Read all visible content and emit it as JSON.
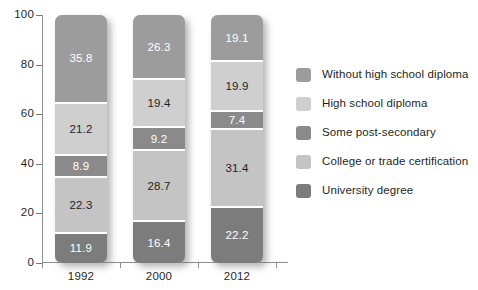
{
  "chart_data": {
    "type": "bar",
    "subtype": "stacked-bar-100",
    "title": "",
    "subtitle": "",
    "xlabel": "",
    "ylabel": "",
    "categories": [
      "1992",
      "2000",
      "2012"
    ],
    "ylim": [
      0,
      100
    ],
    "yticks": [
      0,
      20,
      40,
      60,
      80,
      100
    ],
    "ytick_labels": [
      "0",
      "20",
      "40",
      "60",
      "80",
      "100"
    ],
    "grid": false,
    "legend_position": "right",
    "stack_order_bottom_to_top": [
      "University degree",
      "College or trade certification",
      "Some post-secondary",
      "High school diploma",
      "Without high school diploma"
    ],
    "series": [
      {
        "name": "Without high school diploma",
        "color": "#9c9c9c",
        "text_color": "#ffffff",
        "values": [
          35.8,
          26.3,
          19.1
        ],
        "labels": [
          "35.8",
          "26.3",
          "19.1"
        ]
      },
      {
        "name": "High school diploma",
        "color": "#cfcfcf",
        "text_color": "#1f1f1f",
        "values": [
          21.2,
          19.4,
          19.9
        ],
        "labels": [
          "21.2",
          "19.4",
          "19.9"
        ]
      },
      {
        "name": "Some post-secondary",
        "color": "#8a8a8a",
        "text_color": "#ffffff",
        "values": [
          8.9,
          9.2,
          7.4
        ],
        "labels": [
          "8.9",
          "9.2",
          "7.4"
        ]
      },
      {
        "name": "College or trade certification",
        "color": "#c4c4c4",
        "text_color": "#1f1f1f",
        "values": [
          22.3,
          28.7,
          31.4
        ],
        "labels": [
          "22.3",
          "28.7",
          "31.4"
        ]
      },
      {
        "name": "University degree",
        "color": "#7c7c7c",
        "text_color": "#ffffff",
        "values": [
          11.9,
          16.4,
          22.2
        ],
        "labels": [
          "11.9",
          "16.4",
          "22.2"
        ]
      }
    ],
    "legend_entries": [
      {
        "label": "Without high school diploma",
        "color": "#9c9c9c"
      },
      {
        "label": "High school diploma",
        "color": "#cfcfcf"
      },
      {
        "label": "Some post-secondary",
        "color": "#8a8a8a"
      },
      {
        "label": "College or trade certification",
        "color": "#c4c4c4"
      },
      {
        "label": "University degree",
        "color": "#7c7c7c"
      }
    ]
  },
  "axis_color": "#8d8d8d",
  "background_color": "#ffffff"
}
